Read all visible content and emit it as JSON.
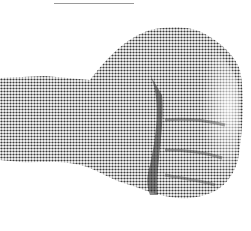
{
  "image": {
    "subject": "clenched fist",
    "style": "halftone",
    "colors": {
      "background": "#ffffff",
      "ink_dark": "#2a2a2a",
      "ink_mid": "#6e6e6e",
      "ink_light": "#b5b5b5",
      "rule": "#9a9a9a"
    }
  }
}
